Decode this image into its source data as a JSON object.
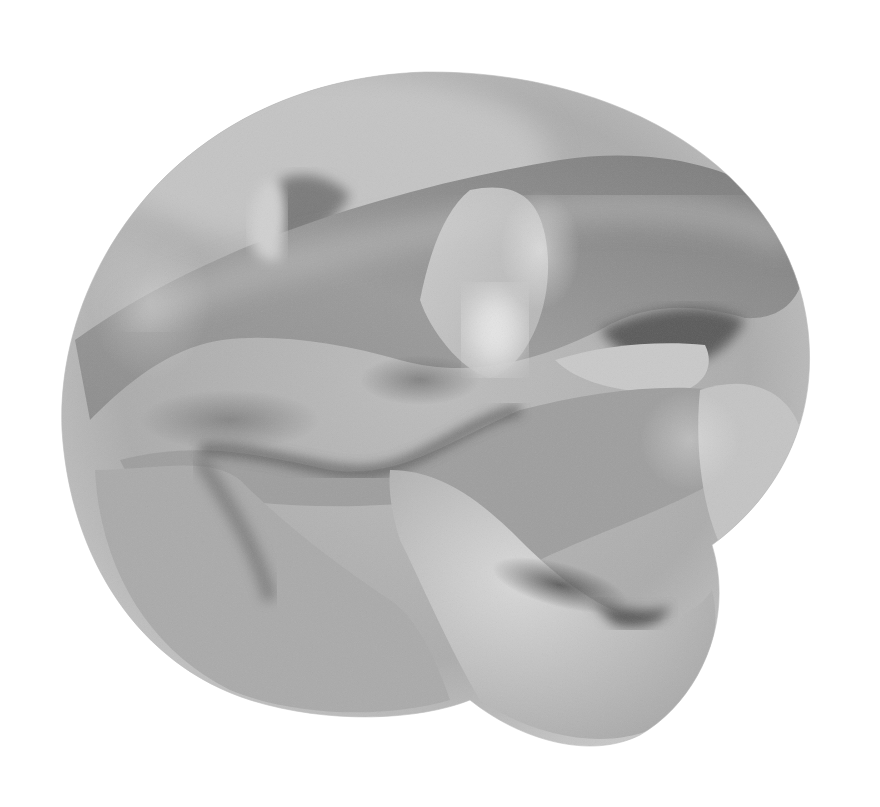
{
  "image": {
    "description": "Grayscale rendering of an intertwined 3D mathematical surface (Calabi-Yau-like cross-section) on a white background",
    "background_color": "#ffffff",
    "palette": {
      "light": "#e2e2e2",
      "mid": "#b4b4b4",
      "dark": "#6a6a6a",
      "deep_shadow": "#4a4a4a"
    }
  }
}
